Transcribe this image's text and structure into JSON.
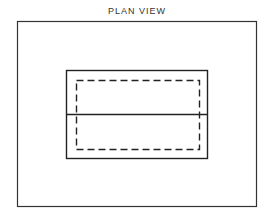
{
  "diagram": {
    "title": "PLAN VIEW",
    "elements": [
      {
        "name": "outer-frame",
        "style": "solid"
      },
      {
        "name": "plan-outline",
        "style": "solid"
      },
      {
        "name": "hidden-outline",
        "style": "dashed"
      },
      {
        "name": "section-line",
        "style": "solid",
        "orientation": "horizontal"
      }
    ],
    "colors": {
      "line": "#222222",
      "background": "#ffffff"
    }
  }
}
